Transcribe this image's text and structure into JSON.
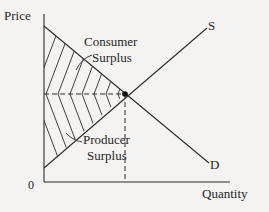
{
  "diagram": {
    "type": "supply-demand",
    "axes": {
      "y_label": "Price",
      "x_label": "Quantity",
      "origin_label": "0"
    },
    "curves": {
      "supply_label": "S",
      "demand_label": "D"
    },
    "regions": {
      "consumer_surplus_line1": "Consumer",
      "consumer_surplus_line2": "Surplus",
      "producer_surplus_line1": "Producer",
      "producer_surplus_line2": "Surplus"
    },
    "equilibrium": {
      "marker": "dot",
      "guides": "dashed"
    },
    "colors": {
      "background": "#f4f3f1",
      "ink": "#2a2a2a"
    }
  }
}
